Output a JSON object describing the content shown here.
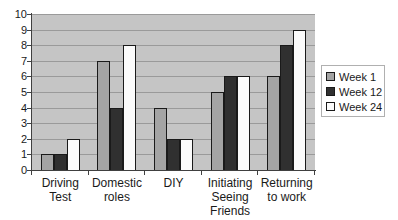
{
  "chart_data": {
    "type": "bar",
    "title": "",
    "xlabel": "",
    "ylabel": "",
    "categories": [
      "Driving\nTest",
      "Domestic\nroles",
      "DIY",
      "Initiating\nSeeing\nFriends",
      "Returning\nto work"
    ],
    "series": [
      {
        "name": "Week 1",
        "color": "#a4a4a4",
        "values": [
          1,
          7,
          4,
          5,
          6
        ]
      },
      {
        "name": "Week 12",
        "color": "#303030",
        "values": [
          1,
          4,
          2,
          6,
          8
        ]
      },
      {
        "name": "Week 24",
        "color": "#fbfbfb",
        "values": [
          2,
          8,
          2,
          6,
          9
        ]
      }
    ],
    "ylim": [
      0,
      10
    ],
    "yticks": [
      0,
      1,
      2,
      3,
      4,
      5,
      6,
      7,
      8,
      9,
      10
    ],
    "grid": true,
    "legend_position": "right"
  },
  "style_colors": {
    "plot_background": "#c5c5c5",
    "gridline": "#9a9a9a",
    "axis": "#404040",
    "bar_border": "#1a1a1a",
    "legend_border": "#b0b0b0",
    "text": "#1a1a1a"
  }
}
